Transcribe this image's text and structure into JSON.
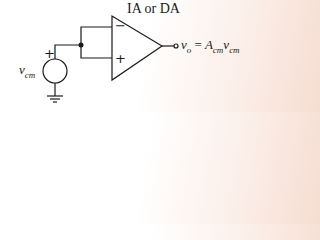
{
  "diagram": {
    "amplifier_label": "IA or DA",
    "source_label": {
      "base": "v",
      "sub": "cm"
    },
    "source_polarity_plus": "+",
    "inverting_input": "−",
    "noninverting_input": "+",
    "output_equation": {
      "lhs_base": "v",
      "lhs_sub": "o",
      "equals": "=",
      "gain_base": "A",
      "gain_sub": "cm",
      "var_base": "v",
      "var_sub": "cm"
    },
    "colors": {
      "line": "#1a1a1a",
      "background_tint": "#f6ddd2"
    }
  }
}
